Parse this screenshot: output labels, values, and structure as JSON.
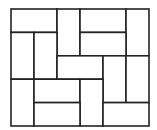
{
  "diagram": {
    "type": "domino-tiling",
    "cols": 6,
    "rows": 5,
    "origin": [
      11,
      9
    ],
    "cell_w": 23,
    "cell_h": 23.4,
    "stroke": "#222222",
    "stroke_width": 1.6,
    "fill": "#ffffff",
    "dominoes": [
      {
        "c": 0,
        "r": 0,
        "w": 2,
        "h": 1
      },
      {
        "c": 2,
        "r": 0,
        "w": 1,
        "h": 2
      },
      {
        "c": 3,
        "r": 0,
        "w": 2,
        "h": 1
      },
      {
        "c": 5,
        "r": 0,
        "w": 1,
        "h": 2
      },
      {
        "c": 3,
        "r": 1,
        "w": 2,
        "h": 1
      },
      {
        "c": 0,
        "r": 1,
        "w": 1,
        "h": 2
      },
      {
        "c": 1,
        "r": 1,
        "w": 1,
        "h": 2
      },
      {
        "c": 2,
        "r": 2,
        "w": 2,
        "h": 1
      },
      {
        "c": 4,
        "r": 2,
        "w": 1,
        "h": 2
      },
      {
        "c": 5,
        "r": 2,
        "w": 1,
        "h": 2
      },
      {
        "c": 0,
        "r": 3,
        "w": 1,
        "h": 2
      },
      {
        "c": 1,
        "r": 3,
        "w": 2,
        "h": 1
      },
      {
        "c": 3,
        "r": 3,
        "w": 1,
        "h": 2
      },
      {
        "c": 1,
        "r": 4,
        "w": 2,
        "h": 1
      },
      {
        "c": 4,
        "r": 4,
        "w": 2,
        "h": 1
      }
    ]
  }
}
